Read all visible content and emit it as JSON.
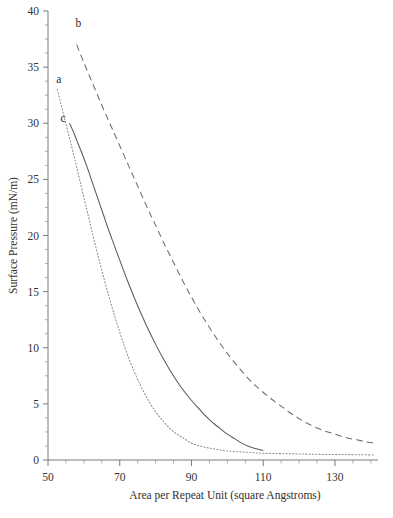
{
  "chart_data": {
    "type": "line",
    "title": "",
    "xlabel": "Area per Repeat Unit (square Angstroms)",
    "ylabel": "Surface Pressure (mN/m)",
    "xlim": [
      50,
      142
    ],
    "ylim": [
      0,
      40
    ],
    "xticks": [
      50,
      70,
      90,
      110,
      130
    ],
    "yticks": [
      0,
      5,
      10,
      15,
      20,
      25,
      30,
      35,
      40
    ],
    "xtick_labels": [
      "50",
      "70",
      "90",
      "110",
      "130"
    ],
    "ytick_labels": [
      "0",
      "5",
      "10",
      "15",
      "20",
      "25",
      "30",
      "35",
      "40"
    ],
    "x_minor_step": 5,
    "y_minor_step": 1.25,
    "grid": false,
    "legend": "inline-labels",
    "series": [
      {
        "name": "a",
        "label": "a",
        "style": "dotted",
        "label_x": 53.0,
        "label_y": 33.6,
        "points": [
          [
            52.6,
            33.0
          ],
          [
            54.0,
            31.2
          ],
          [
            55.5,
            29.3
          ],
          [
            57.0,
            27.4
          ],
          [
            58.5,
            25.4
          ],
          [
            60.0,
            23.4
          ],
          [
            61.5,
            21.4
          ],
          [
            63.0,
            19.4
          ],
          [
            64.5,
            17.5
          ],
          [
            66.0,
            15.7
          ],
          [
            67.5,
            14.0
          ],
          [
            69.0,
            12.4
          ],
          [
            70.5,
            10.9
          ],
          [
            72.0,
            9.5
          ],
          [
            74.0,
            7.9
          ],
          [
            76.0,
            6.5
          ],
          [
            78.0,
            5.3
          ],
          [
            80.0,
            4.3
          ],
          [
            82.0,
            3.5
          ],
          [
            84.0,
            2.8
          ],
          [
            86.0,
            2.3
          ],
          [
            88.0,
            1.9
          ],
          [
            90.0,
            1.5
          ],
          [
            93.0,
            1.2
          ],
          [
            96.0,
            1.0
          ],
          [
            100.0,
            0.8
          ],
          [
            105.0,
            0.7
          ],
          [
            110.0,
            0.6
          ],
          [
            118.0,
            0.55
          ],
          [
            126.0,
            0.5
          ],
          [
            134.0,
            0.48
          ],
          [
            141.0,
            0.45
          ]
        ]
      },
      {
        "name": "b",
        "label": "b",
        "style": "dashed",
        "label_x": 58.5,
        "label_y": 38.6,
        "points": [
          [
            58.0,
            37.0
          ],
          [
            60.0,
            35.4
          ],
          [
            62.5,
            33.5
          ],
          [
            65.0,
            31.6
          ],
          [
            67.5,
            29.8
          ],
          [
            70.0,
            28.0
          ],
          [
            72.5,
            26.2
          ],
          [
            75.0,
            24.4
          ],
          [
            77.5,
            22.6
          ],
          [
            80.0,
            20.9
          ],
          [
            82.5,
            19.2
          ],
          [
            85.0,
            17.6
          ],
          [
            87.5,
            16.0
          ],
          [
            90.0,
            14.5
          ],
          [
            92.5,
            13.1
          ],
          [
            95.0,
            11.8
          ],
          [
            97.5,
            10.6
          ],
          [
            100.0,
            9.5
          ],
          [
            103.0,
            8.3
          ],
          [
            106.0,
            7.2
          ],
          [
            109.0,
            6.3
          ],
          [
            112.0,
            5.5
          ],
          [
            115.0,
            4.8
          ],
          [
            118.0,
            4.1
          ],
          [
            121.0,
            3.5
          ],
          [
            124.0,
            3.0
          ],
          [
            127.0,
            2.6
          ],
          [
            130.0,
            2.3
          ],
          [
            133.0,
            2.0
          ],
          [
            136.0,
            1.8
          ],
          [
            139.0,
            1.6
          ],
          [
            141.5,
            1.5
          ]
        ]
      },
      {
        "name": "c",
        "label": "c",
        "style": "solid",
        "label_x": 54.2,
        "label_y": 30.1,
        "points": [
          [
            56.0,
            30.0
          ],
          [
            57.0,
            29.3
          ],
          [
            58.0,
            28.5
          ],
          [
            59.5,
            27.3
          ],
          [
            61.0,
            26.0
          ],
          [
            62.5,
            24.6
          ],
          [
            64.0,
            23.2
          ],
          [
            65.5,
            21.8
          ],
          [
            67.0,
            20.4
          ],
          [
            68.5,
            19.1
          ],
          [
            70.0,
            17.8
          ],
          [
            72.0,
            16.1
          ],
          [
            74.0,
            14.5
          ],
          [
            76.0,
            13.0
          ],
          [
            78.0,
            11.6
          ],
          [
            80.0,
            10.3
          ],
          [
            82.0,
            9.1
          ],
          [
            84.0,
            8.0
          ],
          [
            86.0,
            7.0
          ],
          [
            88.0,
            6.1
          ],
          [
            90.0,
            5.3
          ],
          [
            92.0,
            4.6
          ],
          [
            94.0,
            3.9
          ],
          [
            96.0,
            3.3
          ],
          [
            98.0,
            2.8
          ],
          [
            100.0,
            2.3
          ],
          [
            102.0,
            1.9
          ],
          [
            104.0,
            1.5
          ],
          [
            106.0,
            1.2
          ],
          [
            108.0,
            1.0
          ],
          [
            110.0,
            0.85
          ]
        ]
      }
    ]
  }
}
